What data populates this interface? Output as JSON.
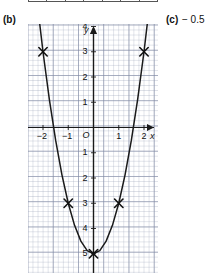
{
  "table_strip": {
    "cells": [
      "-3",
      "-2",
      "-1",
      "0",
      "1",
      "2",
      "3"
    ]
  },
  "parts": {
    "b_label": "(b)",
    "c_label": "(c)",
    "c_answer": "− 0.5"
  },
  "chart_data": {
    "type": "line",
    "title": "",
    "xlabel": "x",
    "ylabel": "y",
    "equation_text": "y = 2x² − 5",
    "xlim": [
      -2.6,
      2.6
    ],
    "ylim": [
      -6.8,
      4.8
    ],
    "grid": true,
    "minor_grid": true,
    "minor_step": 0.2,
    "major_step": 1,
    "origin_label": "O",
    "legend": "none",
    "x_ticks": [
      -2,
      -1,
      1,
      2
    ],
    "x_tick_labels": [
      "−2",
      "−1",
      "1",
      "2"
    ],
    "y_ticks": [
      4,
      3,
      2,
      1,
      -1,
      -2,
      -3,
      -4,
      -5,
      -6
    ],
    "y_tick_labels": [
      "4",
      "3",
      "2",
      "1",
      "1",
      "2",
      "3",
      "4",
      "5",
      "6"
    ],
    "series": [
      {
        "name": "parabola",
        "type": "curve",
        "color": "#1a1a1a",
        "x": [
          -2.25,
          -2.0,
          -1.75,
          -1.5,
          -1.25,
          -1.0,
          -0.75,
          -0.5,
          -0.25,
          0,
          0.25,
          0.5,
          0.75,
          1.0,
          1.25,
          1.5,
          1.75,
          2.0,
          2.25
        ],
        "y": [
          5.125,
          3.0,
          1.125,
          -0.5,
          -1.875,
          -3.0,
          -3.875,
          -4.5,
          -4.875,
          -5.0,
          -4.875,
          -4.5,
          -3.875,
          -3.0,
          -1.875,
          -0.5,
          1.125,
          3.0,
          5.125
        ]
      }
    ],
    "markers": {
      "name": "plotted-points",
      "symbol": "cross-x",
      "points": [
        {
          "x": -2,
          "y": 3
        },
        {
          "x": -1,
          "y": -3
        },
        {
          "x": 0,
          "y": -5
        },
        {
          "x": 1,
          "y": -3
        },
        {
          "x": 2,
          "y": 3
        }
      ]
    }
  }
}
